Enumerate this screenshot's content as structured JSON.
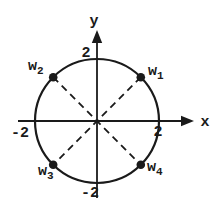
{
  "figure": {
    "background_color": "#ffffff",
    "line_color": "#1a1a1a",
    "axes": {
      "x_label": "x",
      "y_label": "y",
      "x_tick_positive": "2",
      "x_tick_negative": "-2",
      "y_tick_positive": "2",
      "y_tick_negative": "-2"
    },
    "circle": {
      "radius_value": 2,
      "center": "origin"
    },
    "points": [
      {
        "id": "w1",
        "base": "w",
        "sub": "1",
        "position": "upper-right",
        "angle_deg": 45
      },
      {
        "id": "w2",
        "base": "w",
        "sub": "2",
        "position": "upper-left",
        "angle_deg": 135
      },
      {
        "id": "w3",
        "base": "w",
        "sub": "3",
        "position": "lower-left",
        "angle_deg": 225
      },
      {
        "id": "w4",
        "base": "w",
        "sub": "4",
        "position": "lower-right",
        "angle_deg": 315
      }
    ],
    "diagonals": [
      {
        "from": "w1",
        "to": "w3",
        "style": "dashed"
      },
      {
        "from": "w2",
        "to": "w4",
        "style": "dashed"
      }
    ]
  }
}
